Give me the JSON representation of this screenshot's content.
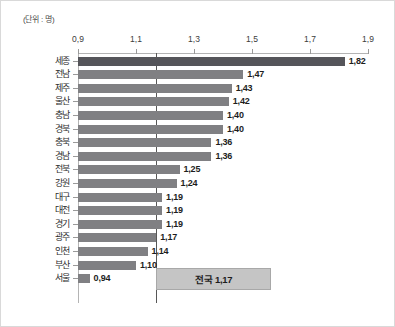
{
  "unit_label": "(단위 : 명)",
  "colors": {
    "bar": "#808083",
    "bar_highlight": "#55555a",
    "avg_line": "#575757",
    "avg_box_fill": "#c5c5c5",
    "axis": "#b4b4b4",
    "frame": "#d9d9d9"
  },
  "average_callout": {
    "label": "전국 1,17",
    "value": 1.17
  },
  "chart_data": {
    "type": "bar",
    "orientation": "horizontal",
    "title": "",
    "subtitle": "",
    "xlabel": "",
    "ylabel": "",
    "unit": "명",
    "xlim": [
      0.9,
      1.9
    ],
    "xticks": [
      0.9,
      1.1,
      1.3,
      1.5,
      1.7,
      1.9
    ],
    "xtick_labels": [
      "0,9",
      "1,1",
      "1,3",
      "1,5",
      "1,7",
      "1,9"
    ],
    "grid": false,
    "legend": null,
    "decimal_separator": ",",
    "reference_line": {
      "value": 1.17,
      "label": "전국 1,17"
    },
    "highlight_index": 0,
    "categories": [
      "세종",
      "전남",
      "제주",
      "울산",
      "충남",
      "경북",
      "충북",
      "경남",
      "전북",
      "강원",
      "대구",
      "대전",
      "경기",
      "광주",
      "인천",
      "부산",
      "서울"
    ],
    "values": [
      1.82,
      1.47,
      1.43,
      1.42,
      1.4,
      1.4,
      1.36,
      1.36,
      1.25,
      1.24,
      1.19,
      1.19,
      1.19,
      1.17,
      1.14,
      1.1,
      0.94
    ],
    "value_labels": [
      "1,82",
      "1,47",
      "1,43",
      "1,42",
      "1,40",
      "1,40",
      "1,36",
      "1,36",
      "1,25",
      "1,24",
      "1,19",
      "1,19",
      "1,19",
      "1,17",
      "1,14",
      "1,10",
      "0,94"
    ]
  }
}
